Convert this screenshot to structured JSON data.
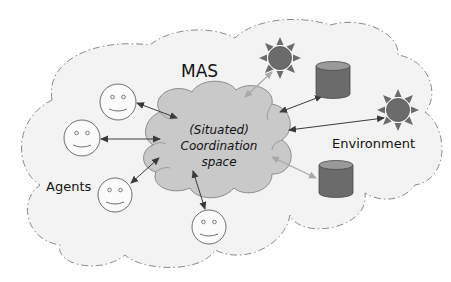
{
  "diagram": {
    "title_label": "MAS",
    "agents_label": "Agents",
    "environment_label": "Environment",
    "coordination_space": {
      "lines": [
        "(Situated)",
        "Coordination",
        "space"
      ]
    },
    "agents": [
      {
        "id": "agent-1"
      },
      {
        "id": "agent-2"
      },
      {
        "id": "agent-3"
      },
      {
        "id": "agent-4"
      }
    ],
    "environment_resources": [
      {
        "id": "sun-1",
        "kind": "sun"
      },
      {
        "id": "database-1",
        "kind": "cylinder"
      },
      {
        "id": "sun-2",
        "kind": "sun"
      },
      {
        "id": "database-2",
        "kind": "cylinder"
      }
    ],
    "connections": [
      {
        "from": "coordination-space",
        "to": "agent-1",
        "style": "dark"
      },
      {
        "from": "coordination-space",
        "to": "agent-2",
        "style": "dark"
      },
      {
        "from": "coordination-space",
        "to": "agent-3",
        "style": "dark"
      },
      {
        "from": "coordination-space",
        "to": "agent-4",
        "style": "dark"
      },
      {
        "from": "coordination-space",
        "to": "sun-1",
        "style": "light"
      },
      {
        "from": "coordination-space",
        "to": "database-1",
        "style": "dark"
      },
      {
        "from": "coordination-space",
        "to": "sun-2",
        "style": "dark"
      },
      {
        "from": "coordination-space",
        "to": "database-2",
        "style": "light"
      }
    ],
    "colors": {
      "mas_fill": "#f3f3f3",
      "mas_border": "#8a8a8a",
      "coord_fill": "#c9c9c9",
      "coord_border": "#8c8c8c",
      "resource_fill": "#6b6b6b",
      "cylinder_top": "#9a9a9a",
      "arrow_dark": "#3a3a3a",
      "arrow_light": "#a8a8a8",
      "agent_stroke": "#6e6e6e"
    }
  }
}
